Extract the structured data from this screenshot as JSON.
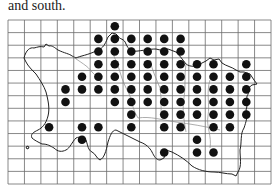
{
  "text": {
    "intro_tail": "and south.",
    "caption": ""
  },
  "map": {
    "grid": {
      "left": 8,
      "top": 20,
      "right": 271,
      "bottom": 184,
      "cols": 16,
      "rows": 13
    },
    "colors": {
      "grid": "#6b6b6b",
      "coast": "#222222",
      "parish": "#8a8a8a",
      "dot": "#111111"
    },
    "dot_radius": 4.3,
    "dots_by_row": [
      [
        6
      ],
      [
        5,
        6,
        7,
        8,
        9,
        10
      ],
      [
        5,
        6,
        7,
        8,
        9,
        10
      ],
      [
        5,
        6,
        7,
        8,
        9,
        10,
        11,
        12,
        14
      ],
      [
        4,
        5,
        6,
        7,
        8,
        9,
        10,
        11,
        12,
        13,
        14
      ],
      [
        3,
        4,
        5,
        6,
        7,
        8,
        9,
        10,
        11,
        12,
        13,
        14
      ],
      [
        3,
        6,
        7,
        8,
        9,
        10,
        11,
        12,
        13,
        14
      ],
      [
        7,
        9,
        10,
        11,
        12,
        13,
        14
      ],
      [
        2,
        4,
        5,
        7,
        9,
        10,
        12,
        13
      ],
      [
        4,
        11
      ],
      [
        9,
        11,
        12
      ],
      [],
      []
    ]
  }
}
